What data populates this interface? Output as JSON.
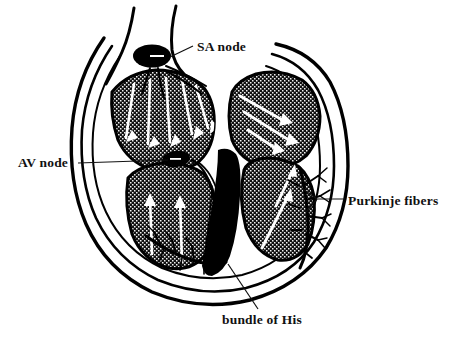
{
  "figure": {
    "type": "anatomical-diagram",
    "background_color": "#ffffff",
    "ink_color": "#000000",
    "myocardium_fill": "#1a1a1a",
    "arrow_color": "#ffffff"
  },
  "labels": {
    "sa_node": "SA node",
    "av_node": "AV node",
    "purkinje_fibers": "Purkinje fibers",
    "bundle_of_his": "bundle of His"
  },
  "structures": [
    {
      "name": "sa-node",
      "label": "SA node",
      "shape": "solid-ellipse"
    },
    {
      "name": "av-node",
      "label": "AV node",
      "shape": "solid-ellipse"
    },
    {
      "name": "purkinje-fibers",
      "label": "Purkinje fibers",
      "shape": "branching-tree"
    },
    {
      "name": "bundle-of-his",
      "label": "bundle of His",
      "shape": "septal-tract"
    },
    {
      "name": "left-atrium",
      "label": "",
      "shape": "stippled-chamber"
    },
    {
      "name": "right-atrium",
      "label": "",
      "shape": "stippled-chamber"
    },
    {
      "name": "left-ventricle",
      "label": "",
      "shape": "stippled-chamber"
    },
    {
      "name": "right-ventricle",
      "label": "",
      "shape": "stippled-chamber"
    }
  ],
  "leader_lines": {
    "sa_node": "from label left edge down-left to SA node ellipse",
    "av_node": "horizontal from label right edge to AV node ellipse",
    "purkinje_fibers": "forked, two branches into fiber tree",
    "bundle_of_his": "from label up to septal conduction tract"
  }
}
